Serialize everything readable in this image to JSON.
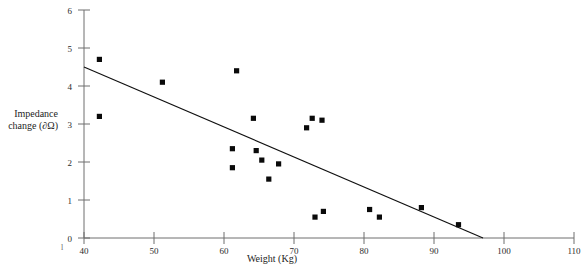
{
  "chart_data": {
    "type": "scatter",
    "title": "",
    "xlabel": "Weight (Kg)",
    "ylabel": "Impedance change (∂Ω)",
    "ylabel_line1": "Impedance",
    "ylabel_line2": "change (∂Ω)",
    "xlim": [
      40,
      110
    ],
    "ylim": [
      0,
      6
    ],
    "xticks": [
      40,
      50,
      60,
      70,
      80,
      90,
      100,
      110
    ],
    "xtick_labels": [
      "40",
      "50",
      "60",
      "70",
      "80",
      "90",
      "100",
      "110"
    ],
    "yticks": [
      0,
      1,
      2,
      3,
      4,
      5,
      6
    ],
    "ytick_labels": [
      "0",
      "1",
      "2",
      "3",
      "4",
      "5",
      "6"
    ],
    "grid": false,
    "legend": "none",
    "marker": "square",
    "marker_color": "#0a0a0a",
    "series": [
      {
        "name": "Impedance change vs weight",
        "points": [
          {
            "x": 42.2,
            "y": 4.7
          },
          {
            "x": 42.2,
            "y": 3.2
          },
          {
            "x": 51.2,
            "y": 4.1
          },
          {
            "x": 61.8,
            "y": 4.4
          },
          {
            "x": 61.2,
            "y": 2.35
          },
          {
            "x": 61.2,
            "y": 1.85
          },
          {
            "x": 64.2,
            "y": 3.15
          },
          {
            "x": 64.6,
            "y": 2.3
          },
          {
            "x": 65.4,
            "y": 2.05
          },
          {
            "x": 66.4,
            "y": 1.55
          },
          {
            "x": 67.8,
            "y": 1.95
          },
          {
            "x": 71.8,
            "y": 2.9
          },
          {
            "x": 72.6,
            "y": 3.15
          },
          {
            "x": 74.0,
            "y": 3.1
          },
          {
            "x": 73.0,
            "y": 0.55
          },
          {
            "x": 74.2,
            "y": 0.7
          },
          {
            "x": 80.8,
            "y": 0.75
          },
          {
            "x": 82.2,
            "y": 0.55
          },
          {
            "x": 88.2,
            "y": 0.8
          },
          {
            "x": 93.5,
            "y": 0.35
          }
        ]
      }
    ],
    "trend_line": {
      "name": "linear fit",
      "x_start": 40.0,
      "y_start": 4.5,
      "x_end": 97.0,
      "y_end": 0.0,
      "color": "#101010"
    }
  },
  "corner_mark": "l"
}
